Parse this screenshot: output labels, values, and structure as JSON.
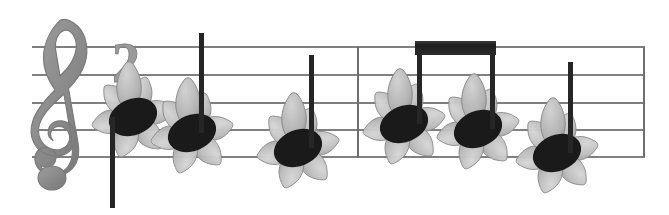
{
  "document": {
    "type": "music-notation",
    "title": "Flower notehead music staff",
    "background_color": "#ffffff",
    "width": 669,
    "height": 215
  },
  "staff": {
    "label": "five-line-staff",
    "line_color": "#808080",
    "line_width": 1.2,
    "left_x": 32,
    "right_x": 645,
    "line_y": [
      47,
      75,
      103,
      130,
      157
    ],
    "line_spacing": 27.5
  },
  "clef": {
    "name": "treble-clef",
    "symbol": "𝄞",
    "color": "#8d8d8d",
    "shadow_color": "#6f6f6f",
    "x": 30,
    "y": 18,
    "height": 175
  },
  "numeral": {
    "name": "time-signature-numeral",
    "text": "2",
    "color": "#9a9a9a",
    "x": 112,
    "y": 36,
    "font_size": 56
  },
  "barlines": [
    {
      "name": "measure-barline",
      "x": 358,
      "y_top": 47,
      "y_bottom": 157,
      "color": "#6e6e6e"
    },
    {
      "name": "end-barline",
      "x": 644,
      "y_top": 47,
      "y_bottom": 157,
      "color": "#6e6e6e"
    }
  ],
  "beam": {
    "name": "eighth-note-beam",
    "color": "#272727",
    "x1": 415,
    "x2": 496,
    "y_top": 41,
    "thickness": 14
  },
  "flower": {
    "petal_light": "#c9c9c9",
    "petal_mid": "#b0b0b0",
    "petal_dark": "#949494",
    "petal_edge": "#8a8a8a",
    "center_bud": "#bdbdbd",
    "petal_count": 6,
    "radius": 34
  },
  "notehead": {
    "color": "#1a1a1a",
    "rx": 25,
    "ry": 18,
    "rotation": -22
  },
  "stem": {
    "color": "#262626",
    "width": 5
  },
  "notes": [
    {
      "name": "note-1",
      "index": 1,
      "measure": 1,
      "cx": 133,
      "cy": 117,
      "staff_position": "below-middle-line",
      "stem_direction": "down",
      "stem_x": 112,
      "stem_y_end": 208,
      "beamed": false,
      "flower_scale": 1.0
    },
    {
      "name": "note-2",
      "index": 2,
      "measure": 1,
      "cx": 192,
      "cy": 133,
      "staff_position": "second-space-from-bottom",
      "stem_direction": "up",
      "stem_x": 201,
      "stem_y_end": 33,
      "beamed": false,
      "flower_scale": 1.0
    },
    {
      "name": "note-3",
      "index": 3,
      "measure": 1,
      "cx": 298,
      "cy": 148,
      "staff_position": "bottom-line",
      "stem_direction": "up",
      "stem_x": 311,
      "stem_y_end": 55,
      "beamed": false,
      "flower_scale": 1.0
    },
    {
      "name": "note-4",
      "index": 4,
      "measure": 2,
      "cx": 404,
      "cy": 124,
      "staff_position": "middle-space",
      "stem_direction": "up",
      "stem_x": 419,
      "stem_y_end": 48,
      "beamed": true,
      "flower_scale": 1.0
    },
    {
      "name": "note-5",
      "index": 5,
      "measure": 2,
      "cx": 478,
      "cy": 129,
      "staff_position": "middle-space",
      "stem_direction": "up",
      "stem_x": 492,
      "stem_y_end": 48,
      "beamed": true,
      "flower_scale": 1.0
    },
    {
      "name": "note-6",
      "index": 6,
      "measure": 2,
      "cx": 557,
      "cy": 153,
      "staff_position": "bottom-line",
      "stem_direction": "up",
      "stem_x": 570,
      "stem_y_end": 62,
      "beamed": false,
      "flower_scale": 1.0
    }
  ]
}
